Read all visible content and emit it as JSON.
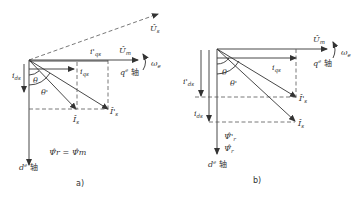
{
  "diagram_a": {
    "caption": "a)",
    "labels": {
      "Us": "Û",
      "Us_sub": "s",
      "Um": "Û",
      "Um_sub": "m",
      "q_axis": "q",
      "q_axis_sup": "e",
      "q_axis_char": " 轴",
      "d_axis": "d",
      "d_axis_sup": "e",
      "d_axis_char": " 轴",
      "omega": "ω",
      "omega_sub": "e",
      "iqs_prime": "i'",
      "iqs_prime_sub": "qs",
      "iqs": "i",
      "iqs_sub": "qs",
      "ids": "i",
      "ids_sub": "ds",
      "theta": "θ",
      "theta_prime": "θ'",
      "Is": "Î",
      "Is_sub": "s",
      "Is_prime": "Î'",
      "Is_prime_sub": "s",
      "psi_eq": "Ψ̂",
      "psi_eq_text": "Ψ̂r = Ψ̂m"
    }
  },
  "diagram_b": {
    "caption": "b)",
    "labels": {
      "Um": "Û",
      "Um_sub": "m",
      "q_axis": "q",
      "q_axis_sup": "e",
      "q_axis_char": " 轴",
      "d_axis": "d",
      "d_axis_sup": "e",
      "d_axis_char": " 轴",
      "omega": "ω",
      "omega_sub": "e",
      "iqs": "i",
      "iqs_sub": "qs",
      "ids_prime": "i'",
      "ids_prime_sub": "ds",
      "ids": "i",
      "ids_sub": "ds",
      "theta": "θ",
      "theta_prime": "θ'",
      "Is": "Î",
      "Is_sub": "s",
      "Is_prime": "Î'",
      "Is_prime_sub": "s",
      "psi_r_prime": "Ψ̂'",
      "psi_r_prime_sub": "r",
      "psi_r": "Ψ̂",
      "psi_r_sub": "r"
    }
  }
}
